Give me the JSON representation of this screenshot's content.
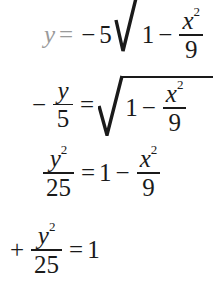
{
  "document": {
    "kind": "math-derivation",
    "background_color": "#ffffff",
    "text_color": "#1a1a1a",
    "faded_text_color": "#9a9a9a"
  },
  "equations": [
    {
      "id": "line-1",
      "latex": "y = -5\\sqrt{1 - \\frac{x^2}{9}}",
      "clipped": "top-and-right",
      "tokens": {
        "lhs_var": "y",
        "equals": "=",
        "minus": "−",
        "coefficient": "5",
        "radicand_one": "1",
        "radicand_minus": "−",
        "frac_num_var": "x",
        "frac_num_exp": "2",
        "frac_den": "9"
      }
    },
    {
      "id": "line-2",
      "latex": "-\\frac{y}{5} = \\sqrt{1 - \\frac{x^2}{9}}",
      "clipped": "none",
      "tokens": {
        "lead_minus": "−",
        "frac_num": "y",
        "frac_den": "5",
        "equals": "=",
        "radicand_one": "1",
        "radicand_minus": "−",
        "inner_num_var": "x",
        "inner_num_exp": "2",
        "inner_den": "9"
      }
    },
    {
      "id": "line-3",
      "latex": "\\frac{y^2}{25} = 1 - \\frac{x^2}{9}",
      "clipped": "none",
      "tokens": {
        "lhs_num_var": "y",
        "lhs_num_exp": "2",
        "lhs_den": "25",
        "equals": "=",
        "rhs_one": "1",
        "rhs_minus": "−",
        "rhs_num_var": "x",
        "rhs_num_exp": "2",
        "rhs_den": "9"
      }
    },
    {
      "id": "line-4",
      "latex": "+ \\frac{y^2}{25} = 1",
      "clipped": "left",
      "tokens": {
        "lead_plus": "+",
        "frac_num_var": "y",
        "frac_num_exp": "2",
        "frac_den": "25",
        "equals": "=",
        "rhs_one": "1"
      }
    }
  ]
}
